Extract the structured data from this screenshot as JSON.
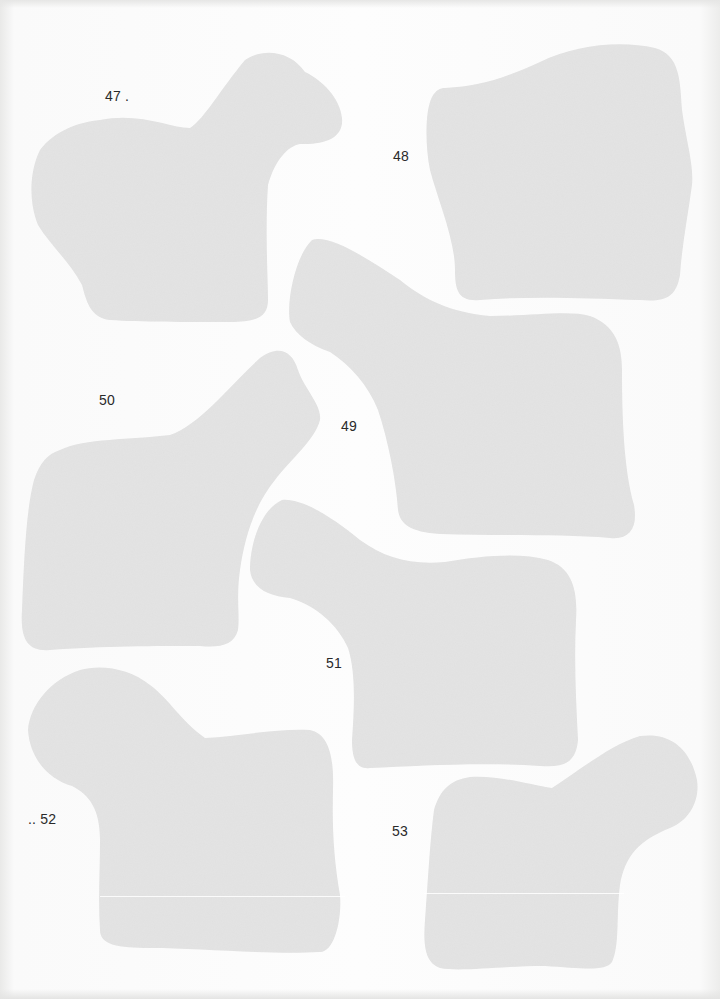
{
  "page": {
    "background": "#fdfdfd",
    "shape_fill": "#e4e4e4",
    "shape_texture": "#d9d9d9"
  },
  "shapes": [
    {
      "id": "47",
      "label": "47 ."
    },
    {
      "id": "48",
      "label": "48"
    },
    {
      "id": "49",
      "label": "49"
    },
    {
      "id": "50",
      "label": "50"
    },
    {
      "id": "51",
      "label": "51"
    },
    {
      "id": "52",
      "label": ".. 52"
    },
    {
      "id": "53",
      "label": "53"
    }
  ]
}
